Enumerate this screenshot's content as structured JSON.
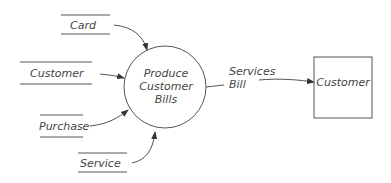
{
  "diagram": {
    "type": "data-flow-diagram",
    "process": {
      "label_lines": [
        "Produce",
        "Customer",
        "Bills"
      ]
    },
    "data_stores": [
      {
        "id": "card",
        "label": "Card"
      },
      {
        "id": "customer",
        "label": "Customer"
      },
      {
        "id": "purchase",
        "label": "Purchase"
      },
      {
        "id": "service",
        "label": "Service"
      }
    ],
    "external_entity": {
      "label": "Customer"
    },
    "output_flow": {
      "label_lines": [
        "Services",
        "Bill"
      ]
    },
    "colors": {
      "stroke": "#555555",
      "text": "#444444",
      "background": "#ffffff"
    }
  }
}
